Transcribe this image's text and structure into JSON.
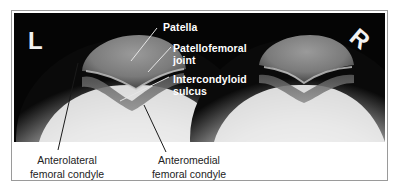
{
  "figure": {
    "side_markers": {
      "left": "L",
      "right": "R"
    },
    "labels": {
      "patella": "Patella",
      "patellofemoral_joint": "Patellofemoral\njoint",
      "intercondyloid_sulcus": "Intercondyloid\nsulcus",
      "anterolateral_condyle": "Anterolateral\nfemoral condyle",
      "anteromedial_condyle": "Anteromedial\nfemoral condyle"
    },
    "colors": {
      "background": "#050505",
      "label_text_light": "#ffffff",
      "label_text_dark": "#222222",
      "frame_border": "#9a9a9a"
    }
  }
}
